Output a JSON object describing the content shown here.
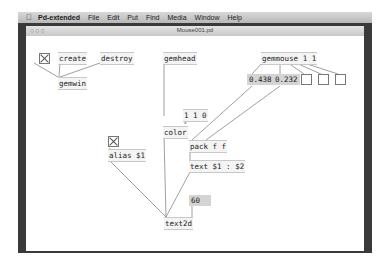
{
  "menubar": {
    "apple_icon": "",
    "app_name": "Pd-extended",
    "items": [
      "File",
      "Edit",
      "Put",
      "Find",
      "Media",
      "Window",
      "Help"
    ]
  },
  "window": {
    "title": "Mouse001.pd",
    "traffic_lights": "○○○"
  },
  "patch": {
    "objects": {
      "create": "create",
      "destroy": "destroy",
      "gemwin": "gemwin",
      "gemhead": "gemhead",
      "gemmouse": "gemmouse 1 1",
      "msg_110": "1 1 0",
      "color": "color",
      "alias": "alias $1",
      "pack": "pack f f",
      "text_msg": "text $1 : $2",
      "text2d": "text2d"
    },
    "numbers": {
      "x": "0.438",
      "y": "0.232",
      "size": "60"
    }
  }
}
